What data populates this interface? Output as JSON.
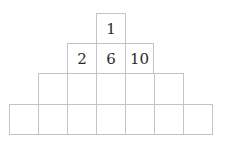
{
  "diagram": {
    "type": "number-pyramid",
    "rows": [
      {
        "row": 1,
        "cells": [
          "1"
        ]
      },
      {
        "row": 2,
        "cells": [
          "2",
          "6",
          "10"
        ]
      },
      {
        "row": 3,
        "cells": [
          "",
          "",
          "",
          "",
          ""
        ]
      },
      {
        "row": 4,
        "cells": [
          "",
          "",
          "",
          "",
          "",
          "",
          ""
        ]
      }
    ]
  }
}
